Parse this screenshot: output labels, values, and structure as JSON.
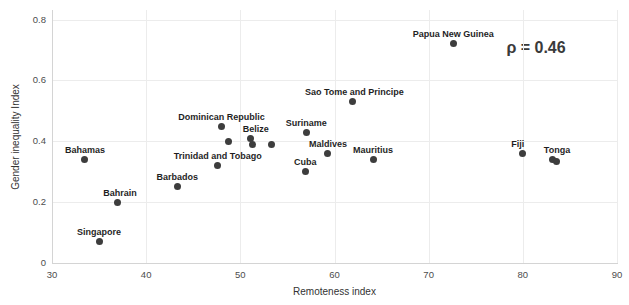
{
  "chart_data": {
    "type": "scatter",
    "title": "",
    "xlabel": "Remoteness index",
    "ylabel": "Gender inequality Index",
    "xlim": [
      30,
      90
    ],
    "ylim": [
      0,
      0.8
    ],
    "x_ticks": [
      "30",
      "40",
      "50",
      "60",
      "70",
      "80",
      "90"
    ],
    "y_ticks": [
      "0",
      "0.2",
      "0.4",
      "0.6",
      "0.8"
    ],
    "grid": "on",
    "legend": "none",
    "annotation": {
      "text": "ρ = 0.46",
      "x": 81.4,
      "y": 0.705
    },
    "points": [
      {
        "label": "Singapore",
        "x": 35.0,
        "y": 0.07
      },
      {
        "label": "Bahamas",
        "x": 33.5,
        "y": 0.34
      },
      {
        "label": "Bahrain",
        "x": 37.0,
        "y": 0.2,
        "label_dx": 2
      },
      {
        "label": "Barbados",
        "x": 43.3,
        "y": 0.25
      },
      {
        "label": "Trinidad and Tobago",
        "x": 47.6,
        "y": 0.32
      },
      {
        "label": "Dominican Republic",
        "x": 48.0,
        "y": 0.45
      },
      {
        "label": "",
        "x": 48.7,
        "y": 0.4
      },
      {
        "label": "Belize",
        "x": 51.1,
        "y": 0.41,
        "label_dx": 5
      },
      {
        "label": "",
        "x": 51.3,
        "y": 0.39
      },
      {
        "label": "",
        "x": 53.3,
        "y": 0.39
      },
      {
        "label": "Cuba",
        "x": 56.9,
        "y": 0.3
      },
      {
        "label": "Suriname",
        "x": 57.0,
        "y": 0.43
      },
      {
        "label": "Maldives",
        "x": 59.3,
        "y": 0.36
      },
      {
        "label": "Sao Tome and Principe",
        "x": 61.9,
        "y": 0.53,
        "label_dx": 2
      },
      {
        "label": "Mauritius",
        "x": 64.1,
        "y": 0.34
      },
      {
        "label": "Papua New Guinea",
        "x": 72.6,
        "y": 0.72
      },
      {
        "label": "Fiji",
        "x": 80.0,
        "y": 0.36,
        "label_dx": -5
      },
      {
        "label": "Tonga",
        "x": 83.1,
        "y": 0.34,
        "label_dx": 5
      },
      {
        "label": "",
        "x": 83.6,
        "y": 0.335
      }
    ]
  },
  "style": {
    "point_color": "#3d3d3d",
    "point_label_color": "#1f1f1f",
    "tick_color": "#4d4d4d",
    "axis_title_color": "#333333",
    "grid_color": "#ececec",
    "axis_line_color": "#d4d4d4",
    "annotation_color": "#3a3a3a",
    "background": "#ffffff"
  }
}
